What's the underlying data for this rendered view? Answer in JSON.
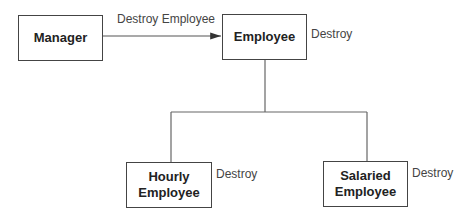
{
  "diagram": {
    "nodes": [
      {
        "id": "manager",
        "label": "Manager"
      },
      {
        "id": "employee",
        "label": "Employee",
        "operation": "Destroy"
      },
      {
        "id": "hourly",
        "label": "Hourly Employee",
        "line1": "Hourly",
        "line2": "Employee",
        "operation": "Destroy"
      },
      {
        "id": "salaried",
        "label": "Salaried Employee",
        "line1": "Salaried",
        "line2": "Employee",
        "operation": "Destroy"
      }
    ],
    "edges": [
      {
        "from": "manager",
        "to": "employee",
        "type": "message",
        "label": "Destroy Employee"
      },
      {
        "from": "hourly",
        "to": "employee",
        "type": "inheritance"
      },
      {
        "from": "salaried",
        "to": "employee",
        "type": "inheritance"
      }
    ],
    "colors": {
      "line": "#555555",
      "text": "#222222",
      "background": "#ffffff"
    }
  }
}
